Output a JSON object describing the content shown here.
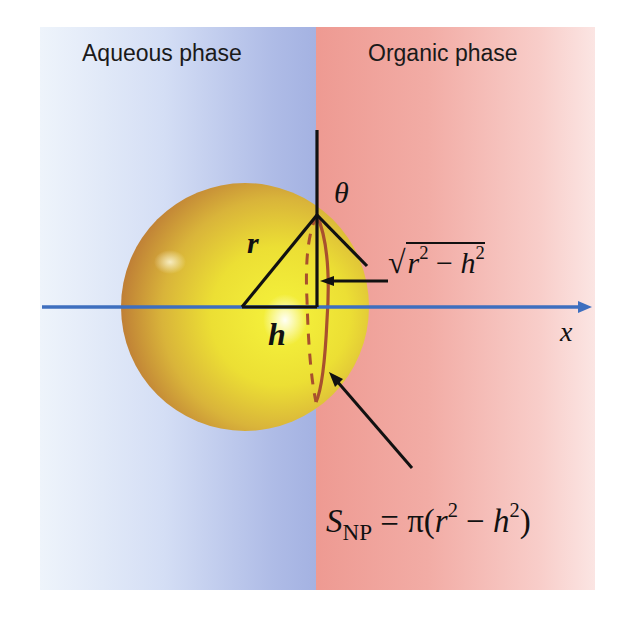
{
  "phases": {
    "left_label": "Aqueous phase",
    "right_label": "Organic phase",
    "left_color": "#aebbe6",
    "right_color": "#ee9a92"
  },
  "geometry_labels": {
    "theta": "θ",
    "radius": "r",
    "offset": "h",
    "axis": "x"
  },
  "sqrt_expression": {
    "radical": "√",
    "r": "r",
    "r_exp": "2",
    "minus": " − ",
    "h": "h",
    "h_exp": "2"
  },
  "area_formula": {
    "S": "S",
    "subscript": "NP",
    "equals_pi": " = π(",
    "r": "r",
    "r_exp": "2",
    "minus": " − ",
    "h": "h",
    "h_exp": "2",
    "close": ")"
  },
  "colors": {
    "axis": "#3e6fbf",
    "sphere_light": "#f0ee3c",
    "sphere_dark": "#c8873a",
    "contact_ring": "#a8502e",
    "lines": "#111111"
  }
}
